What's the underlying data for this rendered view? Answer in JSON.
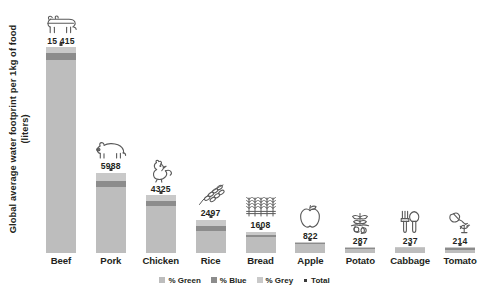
{
  "chart_data": {
    "type": "bar",
    "title": "",
    "subtitle": "",
    "xlabel": "",
    "ylabel": "Global average water footprint per 1kg of food (liters)",
    "ylabel_line1": "Global average water footprint per 1kg of food",
    "ylabel_line2": "(liters)",
    "stacked": true,
    "grid": false,
    "legend_position": "bottom",
    "ylim": [
      0,
      15415
    ],
    "categories": [
      "Beef",
      "Pork",
      "Chicken",
      "Rice",
      "Bread",
      "Apple",
      "Potato",
      "Cabbage",
      "Tomato"
    ],
    "values": [
      15415,
      5988,
      4325,
      2497,
      1608,
      822,
      287,
      237,
      214
    ],
    "value_labels": [
      "15 415",
      "5988",
      "4325",
      "2497",
      "1608",
      "822",
      "287",
      "237",
      "214"
    ],
    "series": [
      {
        "name": "% Green",
        "color": "#bdbdbd",
        "values": [
          14414,
          4907,
          3545,
          1670,
          1225,
          698,
          191,
          194,
          108
        ]
      },
      {
        "name": "% Blue",
        "color": "#8c8c8c",
        "values": [
          550,
          459,
          313,
          341,
          152,
          72,
          33,
          16,
          63
        ]
      },
      {
        "name": "% Grey",
        "color": "#c9c9c9",
        "values": [
          451,
          622,
          467,
          486,
          231,
          52,
          63,
          27,
          43
        ]
      }
    ],
    "marker_series": {
      "name": "Total",
      "color": "#3a3a3a",
      "values": [
        15415,
        5988,
        4325,
        2497,
        1608,
        822,
        287,
        237,
        214
      ]
    },
    "legend": [
      {
        "label": "% Green",
        "swatch": "green"
      },
      {
        "label": "% Blue",
        "swatch": "blue"
      },
      {
        "label": "% Grey",
        "swatch": "grey"
      },
      {
        "label": "Total",
        "swatch": "dot"
      }
    ],
    "icons": [
      "cow-icon",
      "pig-icon",
      "chicken-icon",
      "wheat-sprig-icon",
      "wheat-bundle-icon",
      "apple-icon",
      "potato-plant-icon",
      "garden-tools-icon",
      "watering-can-icon"
    ]
  },
  "colors": {
    "green": "#bdbdbd",
    "blue": "#8c8c8c",
    "grey": "#c9c9c9",
    "total": "#3a3a3a",
    "text": "#231f20",
    "background": "#ffffff"
  }
}
